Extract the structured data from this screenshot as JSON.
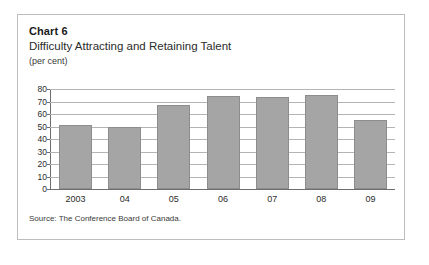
{
  "figure": {
    "number_label": "Chart 6",
    "title": "Difficulty Attracting and Retaining Talent",
    "units": "(per cent)",
    "source": "Source: The Conference Board of Canada."
  },
  "chart_data": {
    "type": "bar",
    "title": "Difficulty Attracting and Retaining Talent",
    "subtitle": "Chart 6",
    "xlabel": "",
    "ylabel": "(per cent)",
    "categories": [
      "2003",
      "04",
      "05",
      "06",
      "07",
      "08",
      "09"
    ],
    "values": [
      51,
      49.5,
      67.5,
      74.5,
      73.5,
      75,
      55
    ],
    "series": [
      {
        "name": "Difficulty Attracting and Retaining Talent",
        "values": [
          51,
          49.5,
          67.5,
          74.5,
          73.5,
          75,
          55
        ]
      }
    ],
    "ylim": [
      0,
      80
    ],
    "ytick_values": [
      0,
      10,
      20,
      30,
      40,
      50,
      60,
      70,
      80
    ],
    "ytick_labels": [
      "0",
      "10",
      "20",
      "30",
      "40",
      "50",
      "60",
      "70",
      "80"
    ],
    "grid": true,
    "legend": false,
    "legend_position": "none",
    "bar_color": "#a5a5a5",
    "gridline_color": "#b4b4b4",
    "axis_color": "#6e6e6e"
  }
}
